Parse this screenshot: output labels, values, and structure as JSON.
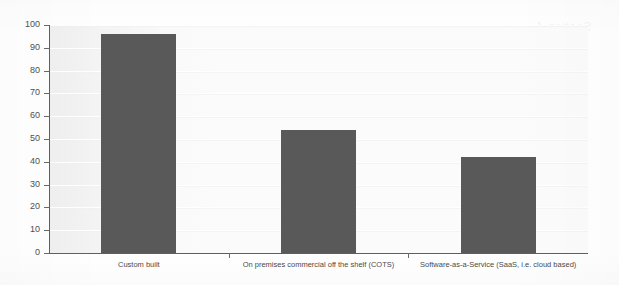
{
  "chart_data": {
    "type": "bar",
    "title": "",
    "subtitle": "",
    "xlabel": "",
    "ylabel": "",
    "ylim": [
      0,
      100
    ],
    "yticks": [
      0,
      10,
      20,
      30,
      40,
      50,
      60,
      70,
      80,
      90,
      100
    ],
    "ytick_labels": [
      "0",
      "10",
      "20",
      "30",
      "40",
      "50",
      "60",
      "70",
      "80",
      "90",
      "100"
    ],
    "grid": true,
    "grid_axis": "y",
    "legend": false,
    "legend_position": "none",
    "categories": [
      "Custom built",
      "On premises commercial off the shelf (COTS)",
      "Software-as-a-Service (SaaS, i.e. cloud based)"
    ],
    "values": [
      96,
      54,
      42
    ],
    "series": [
      {
        "name": "",
        "values": [
          96,
          54,
          42
        ]
      }
    ],
    "annotations": []
  },
  "style": {
    "bar_color": "#595959",
    "plot_background": "#fbfbfb",
    "page_background": "#ffffff",
    "axis_color": "#5f5f5f",
    "tick_label_color": "#4f4f4f",
    "gridline_color": "#ffffff"
  },
  "artifacts": {
    "description": "faint mirrored bleed-through text from reverse of scanned page",
    "ghost_text": [
      "Figure 12: Application hosting",
      "preferred delivery model",
      "cloud based",
      "organisations surveyed",
      "per cent of respondents",
      "shelf software",
      "Section 4"
    ]
  }
}
